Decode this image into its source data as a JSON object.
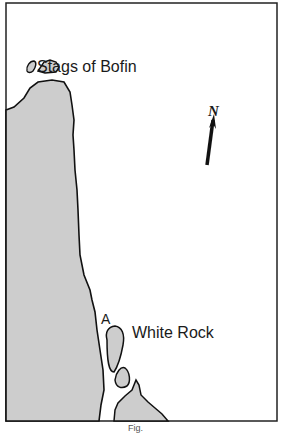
{
  "map": {
    "labels": {
      "stags": "Stags of Bofin",
      "white_rock": "White Rock",
      "point_a": "A",
      "north": "N"
    },
    "caption": "Fig."
  },
  "colors": {
    "land": "#cdcdcd",
    "sea": "#ffffff",
    "outline": "#111111"
  }
}
